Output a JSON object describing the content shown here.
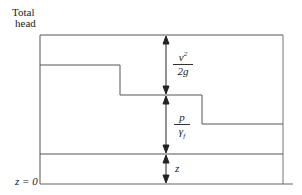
{
  "diagram": {
    "title_line1": "Total",
    "title_line2": "head",
    "datum_label": "z = 0",
    "velocity_head": {
      "numerator": "v",
      "numerator_sup": "2",
      "denominator": "2g"
    },
    "pressure_head": {
      "numerator": "p",
      "denominator": "γ",
      "denominator_sub": "f"
    },
    "elevation_head": "z",
    "colors": {
      "line": "#555555",
      "arrow": "#222222",
      "text": "#222222"
    }
  }
}
